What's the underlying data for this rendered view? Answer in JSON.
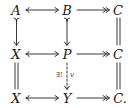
{
  "diagram": {
    "type": "commutative-diagram",
    "nodes": {
      "r1c1": "A",
      "r1c2": "B",
      "r1c3": "C",
      "r2c1": "X",
      "r2c2": "P",
      "r2c3": "C",
      "r3c1": "X",
      "r3c2": "Y",
      "r3c3": "C."
    },
    "arrows": [
      {
        "from": "A",
        "to": "B",
        "style": "monomorphism"
      },
      {
        "from": "B",
        "to": "C",
        "style": "epimorphism"
      },
      {
        "from": "A",
        "to": "X",
        "style": "monomorphism"
      },
      {
        "from": "B",
        "to": "P",
        "style": "monomorphism"
      },
      {
        "from": "C",
        "to": "C",
        "style": "equality"
      },
      {
        "from": "X",
        "to": "P",
        "style": "monomorphism"
      },
      {
        "from": "P",
        "to": "C",
        "style": "epimorphism"
      },
      {
        "from": "X",
        "to": "X",
        "style": "equality"
      },
      {
        "from": "P",
        "to": "Y",
        "style": "dashed",
        "label_left": "∃!",
        "label_right": "v"
      },
      {
        "from": "C",
        "to": "C.",
        "style": "equality"
      },
      {
        "from": "X",
        "to": "Y",
        "style": "monomorphism"
      },
      {
        "from": "Y",
        "to": "C.",
        "style": "epimorphism"
      }
    ],
    "labels": {
      "exists_unique": "∃!",
      "v": "v"
    }
  }
}
